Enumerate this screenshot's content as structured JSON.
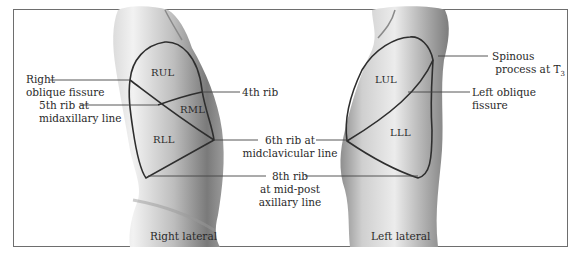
{
  "figure": {
    "views": [
      {
        "caption": "Right lateral",
        "lobes": [
          "RUL",
          "RML",
          "RLL"
        ]
      },
      {
        "caption": "Left lateral",
        "lobes": [
          "LUL",
          "LLL"
        ]
      }
    ],
    "labels": {
      "right_oblique_fissure_1": "Right",
      "right_oblique_fissure_2": "oblique fissure",
      "fifth_rib_1": "5th rib at",
      "fifth_rib_2": "midaxillary line",
      "fourth_rib": "4th rib",
      "sixth_rib_1": "6th rib at",
      "sixth_rib_2": "midclavicular line",
      "eighth_rib_1": "8th rib",
      "eighth_rib_2": "at mid-post",
      "eighth_rib_3": "axillary line",
      "spinous_1": "Spinous",
      "spinous_2": "process at T",
      "spinous_sub": "3",
      "left_oblique_1": "Left oblique",
      "left_oblique_2": "fissure"
    },
    "colors": {
      "border": "#6e6e6e",
      "outline": "#2e2e2e",
      "skin_light": "#e9e9e9",
      "skin_mid": "#b5b5b5",
      "skin_dark": "#6f6f6f"
    }
  }
}
